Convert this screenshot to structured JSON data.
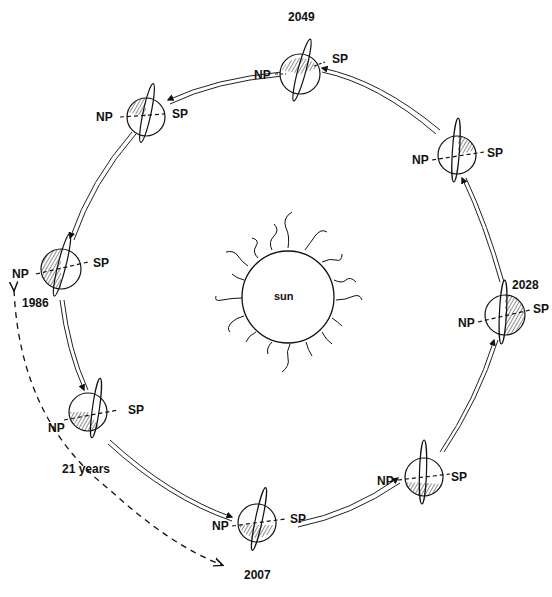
{
  "diagram": {
    "center": {
      "label": "sun"
    },
    "interval_label": "21 years",
    "pole_labels": {
      "north": "NP",
      "south": "SP"
    },
    "positions": [
      {
        "id": "p-top",
        "year": "2049",
        "cx": 300,
        "cy": 74
      },
      {
        "id": "p-upper-left",
        "year": "",
        "cx": 146,
        "cy": 117
      },
      {
        "id": "p-left",
        "year": "1986",
        "cx": 61,
        "cy": 269
      },
      {
        "id": "p-lower-left",
        "year": "",
        "cx": 88,
        "cy": 412
      },
      {
        "id": "p-bottom",
        "year": "2007",
        "cx": 257,
        "cy": 523
      },
      {
        "id": "p-lower-right",
        "year": "",
        "cx": 424,
        "cy": 477
      },
      {
        "id": "p-right",
        "year": "2028",
        "cx": 501,
        "cy": 315
      },
      {
        "id": "p-upper-right",
        "year": "",
        "cx": 457,
        "cy": 154
      }
    ]
  },
  "labels": {
    "y2049": "2049",
    "y1986": "1986",
    "y2007": "2007",
    "y2028": "2028",
    "years21": "21 years",
    "sun": "sun",
    "np": "NP",
    "sp": "SP"
  }
}
